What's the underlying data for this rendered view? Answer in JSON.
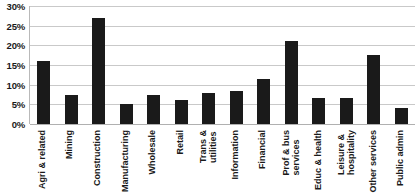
{
  "chart_data": {
    "type": "bar",
    "title": "",
    "xlabel": "",
    "ylabel": "",
    "ylim": [
      0,
      30
    ],
    "ytick_labels": [
      "30%",
      "25%",
      "20%",
      "15%",
      "10%",
      "5%",
      "0%"
    ],
    "ytick_values": [
      30,
      25,
      20,
      15,
      10,
      5,
      0
    ],
    "grid": true,
    "legend": "none",
    "bar_color": "#1a1a1a",
    "grid_color": "#c9c9c9",
    "categories": [
      "Agri & related",
      "Mining",
      "Construction",
      "Manufacturing",
      "Wholesale",
      "Retail",
      "Trans & utilities",
      "Information",
      "Financial",
      "Prof & bus services",
      "Educ & health",
      "Leisure & hospitality",
      "Other services",
      "Public admin"
    ],
    "category_lines": [
      [
        "Agri & related"
      ],
      [
        "Mining"
      ],
      [
        "Construction"
      ],
      [
        "Manufacturing"
      ],
      [
        "Wholesale"
      ],
      [
        "Retail"
      ],
      [
        "Trans &",
        "utilities"
      ],
      [
        "Information"
      ],
      [
        "Financial"
      ],
      [
        "Prof & bus",
        "services"
      ],
      [
        "Educ & health"
      ],
      [
        "Leisure &",
        "hospitality"
      ],
      [
        "Other services"
      ],
      [
        "Public admin"
      ]
    ],
    "values": [
      16,
      7.5,
      27,
      5,
      7.5,
      6,
      8,
      8.5,
      11.5,
      21,
      6.5,
      6.5,
      17.5,
      4
    ]
  }
}
